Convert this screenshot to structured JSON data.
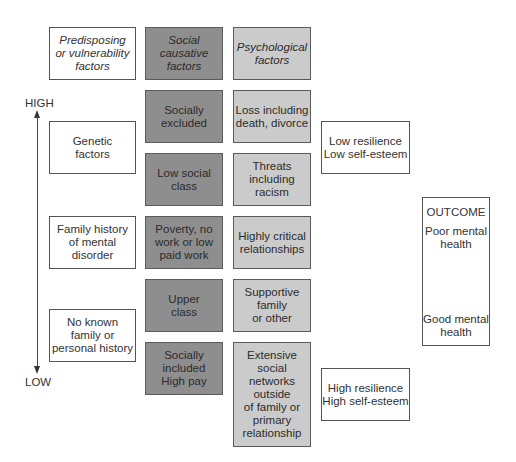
{
  "axis": {
    "high_label": "HIGH",
    "low_label": "LOW"
  },
  "headers": {
    "predisposing": "Predisposing\nor vulnerability\nfactors",
    "social": "Social\ncausative\nfactors",
    "psychological": "Psychological\nfactors"
  },
  "predisposing": [
    "Genetic\nfactors",
    "Family history\nof mental\ndisorder",
    "No known\nfamily or\npersonal history"
  ],
  "social": [
    "Socially\nexcluded",
    "Low social\nclass",
    "Poverty, no\nwork or low\npaid work",
    "Upper\nclass",
    "Socially\nincluded\nHigh pay"
  ],
  "psychological": [
    "Loss including\ndeath, divorce",
    "Threats\nincluding\nracism",
    "Highly critical\nrelationships",
    "Supportive\nfamily\nor other",
    "Extensive\nsocial\nnetworks\noutside\nof family or\nprimary\nrelationship"
  ],
  "resilience": {
    "low": "Low resilience\nLow self-esteem",
    "high": "High resilience\nHigh self-esteem"
  },
  "outcome": {
    "title": "OUTCOME",
    "poor": "Poor mental\nhealth",
    "good": "Good mental\nhealth"
  },
  "colors": {
    "social_fill": "#8e8e8e",
    "psychological_fill": "#cbcbcb",
    "predisposing_fill": "#ffffff"
  }
}
